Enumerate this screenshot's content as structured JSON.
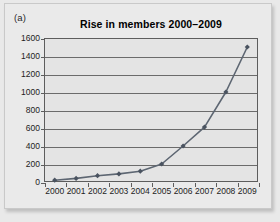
{
  "figure": {
    "panel_label": "(a)",
    "title": "Rise in members 2000–2009"
  },
  "style": {
    "series_color": "#5d6672",
    "marker_color": "#4a5360",
    "plot_background": "#e4e4e4",
    "axis_color": "#5d5d5d",
    "grid_color": "#6b6b6b",
    "page_background": "#eaeaea",
    "text_color": "#1d1d1d"
  },
  "chart_data": {
    "type": "line",
    "title": "Rise in members 2000–2009",
    "xlabel": "",
    "ylabel": "",
    "categories": [
      "2000",
      "2001",
      "2002",
      "2003",
      "2004",
      "2005",
      "2006",
      "2007",
      "2008",
      "2009"
    ],
    "x": [
      2000,
      2001,
      2002,
      2003,
      2004,
      2005,
      2006,
      2007,
      2008,
      2009
    ],
    "values": [
      20,
      40,
      70,
      90,
      120,
      200,
      400,
      610,
      1000,
      1500
    ],
    "series": [
      {
        "name": "Members",
        "values": [
          20,
          40,
          70,
          90,
          120,
          200,
          400,
          610,
          1000,
          1500
        ]
      }
    ],
    "ylim": [
      0,
      1600
    ],
    "yticks": [
      0,
      200,
      400,
      600,
      800,
      1000,
      1200,
      1400,
      1600
    ],
    "ytick_labels": [
      "0",
      "200",
      "400",
      "600",
      "800",
      "1000",
      "1200",
      "1400",
      "1600"
    ],
    "xtick_labels": [
      "2000",
      "2001",
      "2002",
      "2003",
      "2004",
      "2005",
      "2006",
      "2007",
      "2008",
      "2009"
    ],
    "grid": true,
    "grid_axis": "y",
    "legend": false,
    "legend_position": "none",
    "markers": "diamond"
  }
}
